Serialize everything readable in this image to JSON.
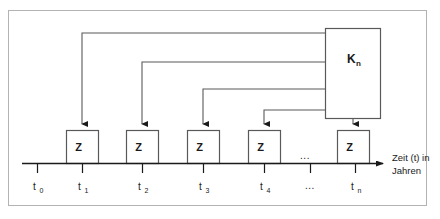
{
  "diagram": {
    "colors": {
      "frame_border": "#b3b3b3",
      "shape_stroke": "#595959",
      "line_stroke": "#595959",
      "arrow_fill": "#1a1a1a",
      "text": "#1a1a1a",
      "background": "#ffffff"
    },
    "capital_box": {
      "label": "K",
      "subscript": "n",
      "full_label": "Kn"
    },
    "payment_boxes": [
      {
        "label": "Z",
        "tick": "t1"
      },
      {
        "label": "Z",
        "tick": "t2"
      },
      {
        "label": "Z",
        "tick": "t3"
      },
      {
        "label": "Z",
        "tick": "t4"
      },
      {
        "label": "Z",
        "tick": "tn"
      }
    ],
    "axis": {
      "label_line1": "Zeit (t) in",
      "label_line2": "Jahren",
      "ellipsis": "..."
    },
    "ticks": [
      {
        "base": "t",
        "sub": "0"
      },
      {
        "base": "t",
        "sub": "1"
      },
      {
        "base": "t",
        "sub": "2"
      },
      {
        "base": "t",
        "sub": "3"
      },
      {
        "base": "t",
        "sub": "4"
      },
      {
        "base": "...",
        "sub": ""
      },
      {
        "base": "t",
        "sub": "n"
      }
    ],
    "inner_ellipsis": "..."
  }
}
